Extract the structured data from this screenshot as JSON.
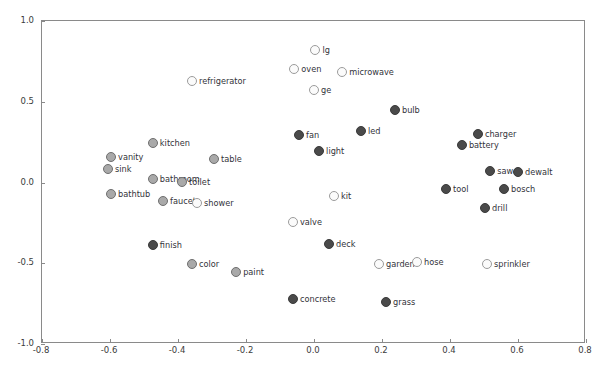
{
  "chart_data": {
    "type": "scatter",
    "title": "",
    "xlabel": "",
    "ylabel": "",
    "xlim": [
      -0.8,
      0.8
    ],
    "ylim": [
      -1.0,
      1.0
    ],
    "grid": false,
    "legend": false,
    "xticks": [
      "-0.8",
      "-0.6",
      "-0.4",
      "-0.2",
      "0.0",
      "0.2",
      "0.4",
      "0.6",
      "0.8"
    ],
    "xtickvalues": [
      -0.8,
      -0.6,
      -0.4,
      -0.2,
      0.0,
      0.2,
      0.4,
      0.6,
      0.8
    ],
    "yticks": [
      "1.0",
      "0.5",
      "0.0",
      "-0.5",
      "-1.0"
    ],
    "ytickvalues": [
      1.0,
      0.5,
      0.0,
      -0.5,
      -1.0
    ],
    "marker_styles": {
      "light": "#fbfbfb",
      "mid": "#a9a9a9",
      "dark": "#4a4a4a",
      "edge": "#6f6f6f"
    },
    "points": [
      {
        "label": "lg",
        "x": 0.007,
        "y": 0.814,
        "style": "light"
      },
      {
        "label": "oven",
        "x": -0.055,
        "y": 0.697,
        "style": "light"
      },
      {
        "label": "microwave",
        "x": 0.086,
        "y": 0.678,
        "style": "light"
      },
      {
        "label": "refrigerator",
        "x": -0.356,
        "y": 0.622,
        "style": "light"
      },
      {
        "label": "ge",
        "x": 0.003,
        "y": 0.566,
        "style": "light"
      },
      {
        "label": "bulb",
        "x": 0.241,
        "y": 0.443,
        "style": "dark"
      },
      {
        "label": "charger",
        "x": 0.485,
        "y": 0.294,
        "style": "dark"
      },
      {
        "label": "fan",
        "x": -0.041,
        "y": 0.288,
        "style": "dark"
      },
      {
        "label": "led",
        "x": 0.141,
        "y": 0.312,
        "style": "dark"
      },
      {
        "label": "kitchen",
        "x": -0.471,
        "y": 0.238,
        "style": "mid"
      },
      {
        "label": "battery",
        "x": 0.438,
        "y": 0.226,
        "style": "dark"
      },
      {
        "label": "light",
        "x": 0.018,
        "y": 0.188,
        "style": "dark"
      },
      {
        "label": "vanity",
        "x": -0.594,
        "y": 0.152,
        "style": "mid"
      },
      {
        "label": "table",
        "x": -0.291,
        "y": 0.139,
        "style": "mid"
      },
      {
        "label": "sink",
        "x": -0.603,
        "y": 0.078,
        "style": "mid"
      },
      {
        "label": "bathroom",
        "x": -0.471,
        "y": 0.016,
        "style": "mid"
      },
      {
        "label": "saw",
        "x": 0.521,
        "y": 0.065,
        "style": "dark"
      },
      {
        "label": "dewalt",
        "x": 0.603,
        "y": 0.059,
        "style": "dark"
      },
      {
        "label": "toilet",
        "x": -0.385,
        "y": -0.003,
        "style": "mid"
      },
      {
        "label": "bosch",
        "x": 0.562,
        "y": -0.046,
        "style": "dark"
      },
      {
        "label": "bathtub",
        "x": -0.594,
        "y": -0.077,
        "style": "mid"
      },
      {
        "label": "tool",
        "x": 0.391,
        "y": -0.046,
        "style": "dark"
      },
      {
        "label": "faucet",
        "x": -0.441,
        "y": -0.121,
        "style": "mid"
      },
      {
        "label": "shower",
        "x": -0.341,
        "y": -0.133,
        "style": "light"
      },
      {
        "label": "drill",
        "x": 0.506,
        "y": -0.164,
        "style": "dark"
      },
      {
        "label": "kit",
        "x": 0.062,
        "y": -0.09,
        "style": "light"
      },
      {
        "label": "valve",
        "x": -0.059,
        "y": -0.251,
        "style": "light"
      },
      {
        "label": "finish",
        "x": -0.471,
        "y": -0.394,
        "style": "dark"
      },
      {
        "label": "deck",
        "x": 0.047,
        "y": -0.387,
        "style": "dark"
      },
      {
        "label": "color",
        "x": -0.356,
        "y": -0.511,
        "style": "mid"
      },
      {
        "label": "garden",
        "x": 0.194,
        "y": -0.511,
        "style": "light"
      },
      {
        "label": "hose",
        "x": 0.306,
        "y": -0.499,
        "style": "light"
      },
      {
        "label": "sprinkler",
        "x": 0.512,
        "y": -0.511,
        "style": "light"
      },
      {
        "label": "paint",
        "x": -0.226,
        "y": -0.56,
        "style": "mid"
      },
      {
        "label": "concrete",
        "x": -0.059,
        "y": -0.728,
        "style": "dark"
      },
      {
        "label": "grass",
        "x": 0.215,
        "y": -0.746,
        "style": "dark"
      }
    ]
  }
}
